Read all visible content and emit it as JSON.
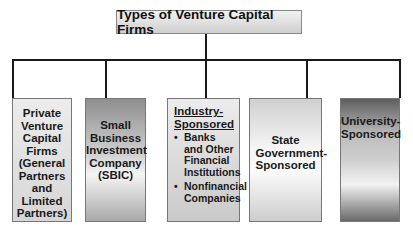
{
  "title": "Types of Venture Capital Firms",
  "categories": [
    {
      "label": "Private Venture Capital Firms (General Partners and Limited Partners)"
    },
    {
      "label": "Small Business Investment Company (SBIC)"
    },
    {
      "label": "Industry-Sponsored",
      "items": [
        "Banks and Other Financial Institutions",
        "Nonfinancial Companies"
      ]
    },
    {
      "label": "State Government-Sponsored"
    },
    {
      "label": "University-Sponsored"
    }
  ],
  "bullet_glyph": "•"
}
